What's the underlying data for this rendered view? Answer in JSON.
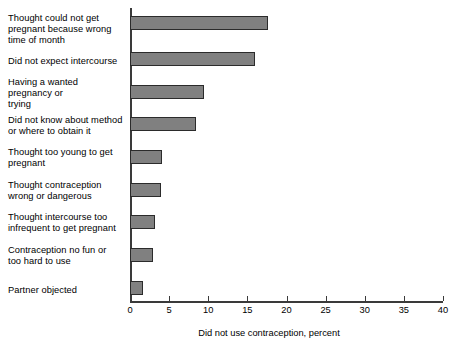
{
  "chart_data": {
    "type": "bar",
    "orientation": "horizontal",
    "title": "",
    "xlabel": "Did not use contraception, percent",
    "ylabel": "",
    "xlim": [
      0,
      40
    ],
    "xticks": [
      0,
      5,
      10,
      15,
      20,
      25,
      30,
      35,
      40
    ],
    "xtick_labels": [
      "0",
      "5",
      "10",
      "15",
      "20",
      "25",
      "30",
      "35",
      "40"
    ],
    "grid": false,
    "legend": false,
    "bar_color": "#808080",
    "bar_edge_color": "#2b2b2b",
    "categories": [
      "Thought could not get\npregnant because wrong\ntime of month",
      "Did not expect intercourse",
      "Having a wanted\npregnancy or\ntrying",
      "Did not know about method\nor where to obtain it",
      "Thought too young to get\npregnant",
      "Thought contraception\nwrong or dangerous",
      "Thought intercourse too\ninfrequent to get pregnant",
      "Contraception no fun or\ntoo hard to use",
      "Partner objected"
    ],
    "values": [
      17.6,
      16.0,
      9.5,
      8.4,
      4.1,
      3.9,
      3.2,
      2.9,
      1.6
    ]
  }
}
